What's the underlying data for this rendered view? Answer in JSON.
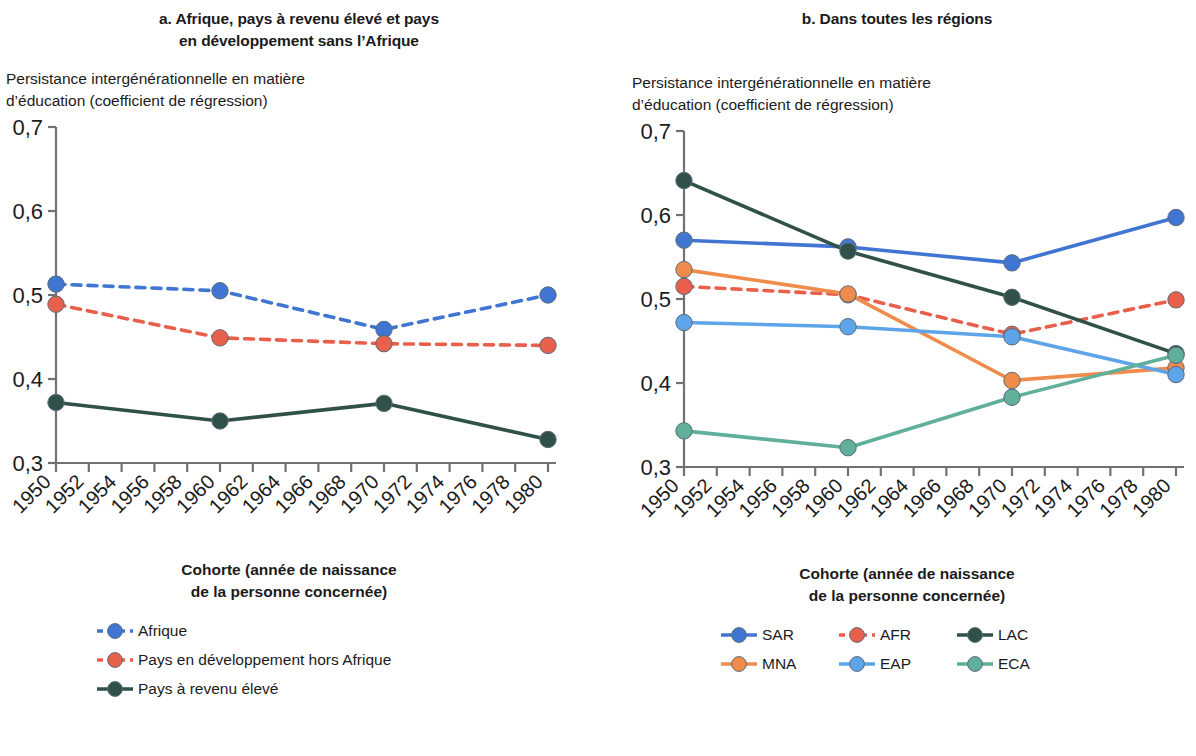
{
  "panels": [
    {
      "id": "a",
      "title": "a. Afrique, pays à revenu élevé et pays\nen développement sans l’Afrique",
      "y_axis_caption": "Persistance intergénérationnelle en matière\nd’éducation (coefficient de régression)",
      "x_axis_caption": "Cohorte (année de naissance\nde la personne concernée)"
    },
    {
      "id": "b",
      "title": "b. Dans toutes les régions",
      "y_axis_caption": "Persistance intergénérationnelle en matière\nd’éducation (coefficient de régression)",
      "x_axis_caption": "Cohorte (année de naissance\nde la personne concernée)"
    }
  ],
  "chart_data": [
    {
      "type": "line",
      "panel": "a",
      "title": "a. Afrique, pays à revenu élevé et pays en développement sans l’Afrique",
      "xlabel": "Cohorte (année de naissance de la personne concernée)",
      "ylabel": "Persistance intergénérationnelle en matière d’éducation (coefficient de régression)",
      "x": [
        1950,
        1960,
        1970,
        1980
      ],
      "xlim": [
        1950,
        1980
      ],
      "ylim": [
        0.3,
        0.7
      ],
      "yticks": [
        0.3,
        0.4,
        0.5,
        0.6,
        0.7
      ],
      "ytick_labels": [
        "0,3",
        "0,4",
        "0,5",
        "0,6",
        "0,7"
      ],
      "xticks": [
        1950,
        1952,
        1954,
        1956,
        1958,
        1960,
        1962,
        1964,
        1966,
        1968,
        1970,
        1972,
        1974,
        1976,
        1978,
        1980
      ],
      "xtick_labels": [
        "1950",
        "1952",
        "1954",
        "1956",
        "1958",
        "1960",
        "1962",
        "1964",
        "1966",
        "1968",
        "1970",
        "1972",
        "1974",
        "1976",
        "1978",
        "1980"
      ],
      "grid": false,
      "legend_position": "below",
      "series": [
        {
          "name": "Afrique",
          "values": [
            0.513,
            0.505,
            0.459,
            0.5
          ],
          "color": "#4076D2",
          "dash": "dashed"
        },
        {
          "name": "Pays en développement hors Afrique",
          "values": [
            0.489,
            0.449,
            0.442,
            0.44
          ],
          "color": "#E8604C",
          "dash": "dashed"
        },
        {
          "name": "Pays à revenu élevé",
          "values": [
            0.372,
            0.35,
            0.371,
            0.328
          ],
          "color": "#30514A",
          "dash": "solid"
        }
      ]
    },
    {
      "type": "line",
      "panel": "b",
      "title": "b. Dans toutes les régions",
      "xlabel": "Cohorte (année de naissance de la personne concernée)",
      "ylabel": "Persistance intergénérationnelle en matière d’éducation (coefficient de régression)",
      "x": [
        1950,
        1960,
        1970,
        1980
      ],
      "xlim": [
        1950,
        1980
      ],
      "ylim": [
        0.3,
        0.7
      ],
      "yticks": [
        0.3,
        0.4,
        0.5,
        0.6,
        0.7
      ],
      "ytick_labels": [
        "0,3",
        "0,4",
        "0,5",
        "0,6",
        "0,7"
      ],
      "xticks": [
        1950,
        1952,
        1954,
        1956,
        1958,
        1960,
        1962,
        1964,
        1966,
        1968,
        1970,
        1972,
        1974,
        1976,
        1978,
        1980
      ],
      "xtick_labels": [
        "1950",
        "1952",
        "1954",
        "1956",
        "1958",
        "1960",
        "1962",
        "1964",
        "1966",
        "1968",
        "1970",
        "1972",
        "1974",
        "1976",
        "1978",
        "1980"
      ],
      "grid": false,
      "legend_position": "below",
      "series": [
        {
          "name": "SAR",
          "values": [
            0.57,
            0.562,
            0.543,
            0.597
          ],
          "color": "#4076D2",
          "dash": "solid"
        },
        {
          "name": "AFR",
          "values": [
            0.515,
            0.505,
            0.458,
            0.499
          ],
          "color": "#E8604C",
          "dash": "dashed"
        },
        {
          "name": "LAC",
          "values": [
            0.641,
            0.557,
            0.502,
            0.435
          ],
          "color": "#30514A",
          "dash": "solid"
        },
        {
          "name": "MNA",
          "values": [
            0.535,
            0.506,
            0.403,
            0.418
          ],
          "color": "#F08C4B",
          "dash": "solid"
        },
        {
          "name": "EAP",
          "values": [
            0.472,
            0.467,
            0.455,
            0.41
          ],
          "color": "#5DA5E8",
          "dash": "solid"
        },
        {
          "name": "ECA",
          "values": [
            0.343,
            0.323,
            0.383,
            0.433
          ],
          "color": "#5FAF9B",
          "dash": "solid"
        }
      ]
    }
  ],
  "legends": {
    "a": [
      {
        "label": "Afrique",
        "color": "#4076D2",
        "dash": "dashed"
      },
      {
        "label": "Pays en développement hors Afrique",
        "color": "#E8604C",
        "dash": "dashed"
      },
      {
        "label": "Pays à revenu élevé",
        "color": "#30514A",
        "dash": "solid"
      }
    ],
    "b": [
      {
        "label": "SAR",
        "color": "#4076D2",
        "dash": "solid"
      },
      {
        "label": "AFR",
        "color": "#E8604C",
        "dash": "dashed"
      },
      {
        "label": "LAC",
        "color": "#30514A",
        "dash": "solid"
      },
      {
        "label": "MNA",
        "color": "#F08C4B",
        "dash": "solid"
      },
      {
        "label": "EAP",
        "color": "#5DA5E8",
        "dash": "solid"
      },
      {
        "label": "ECA",
        "color": "#5FAF9B",
        "dash": "solid"
      }
    ]
  },
  "colors": {
    "axis": "#6f7271",
    "text": "#1b1b1b",
    "background": "#ffffff"
  }
}
